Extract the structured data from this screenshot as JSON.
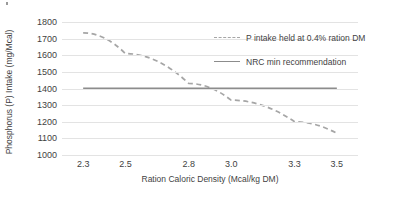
{
  "chart_data": {
    "type": "line",
    "title": "",
    "xlabel": "Ration Caloric Density (Mcal/kg DM)",
    "ylabel": "Phosphorus (P) Intake (mg/Mcal)",
    "xlim": [
      2.2,
      3.6
    ],
    "ylim": [
      1000,
      1800
    ],
    "ytick_labels": [
      "1800",
      "1700",
      "1600",
      "1500",
      "1400",
      "1300",
      "1200",
      "1100",
      "1000"
    ],
    "ytick_values": [
      1800,
      1700,
      1600,
      1500,
      1400,
      1300,
      1200,
      1100,
      1000
    ],
    "xtick_labels": [
      "2.3",
      "2.5",
      "2.8",
      "3.0",
      "3.3",
      "3.5"
    ],
    "xtick_values": [
      2.3,
      2.5,
      2.8,
      3.0,
      3.3,
      3.5
    ],
    "grid": true,
    "legend_position": "top-right",
    "series": [
      {
        "name": "P intake held at 0.4% ration DM",
        "style": "dashed",
        "color": "#a6a6a6",
        "x": [
          2.3,
          2.5,
          2.8,
          3.0,
          3.3,
          3.5
        ],
        "values": [
          1735,
          1610,
          1430,
          1330,
          1200,
          1130
        ]
      },
      {
        "name": "NRC min recommendation",
        "style": "solid",
        "color": "#8c8c8c",
        "x": [
          2.3,
          2.5,
          2.8,
          3.0,
          3.3,
          3.5
        ],
        "values": [
          1400,
          1400,
          1400,
          1400,
          1400,
          1400
        ]
      }
    ]
  },
  "legend": {
    "entries": [
      {
        "label": "P intake held at 0.4% ration DM"
      },
      {
        "label": "NRC min recommendation"
      }
    ]
  },
  "axes": {
    "y_title": "Phosphorus (P) Intake (mg/Mcal)",
    "x_title": "Ration Caloric Density (Mcal/kg DM)"
  }
}
